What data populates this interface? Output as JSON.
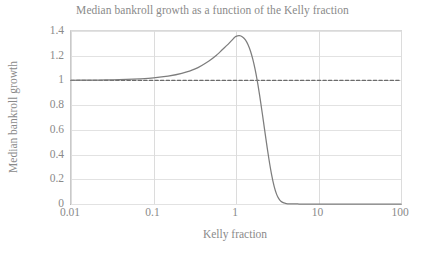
{
  "chart_data": {
    "type": "line",
    "title": "Median bankroll growth as a function of the Kelly fraction",
    "xlabel": "Kelly fraction",
    "ylabel": "Median bankroll growth",
    "xscale": "log",
    "yscale": "linear",
    "xlim": [
      0.01,
      100
    ],
    "ylim": [
      0,
      1.4
    ],
    "grid": true,
    "legend": "none",
    "xticks": [
      0.01,
      0.1,
      1,
      10,
      100
    ],
    "xtick_labels": [
      "0.01",
      "0.1",
      "1",
      "10",
      "100"
    ],
    "yticks": [
      0,
      0.2,
      0.4,
      0.6,
      0.8,
      1,
      1.2,
      1.4
    ],
    "ytick_labels": [
      "0",
      "0.2",
      "0.4",
      "0.6",
      "0.8",
      "1",
      "1.2",
      "1.4"
    ],
    "series": [
      {
        "name": "Median bankroll growth",
        "style": "solid",
        "color": "#7d7d7d",
        "x": [
          0.01,
          0.015,
          0.022,
          0.032,
          0.047,
          0.068,
          0.1,
          0.15,
          0.22,
          0.32,
          0.47,
          0.6,
          0.68,
          0.8,
          0.9,
          0.95,
          1.0,
          1.1,
          1.2,
          1.3,
          1.4,
          1.5,
          1.6,
          1.7,
          1.8,
          1.9,
          2.0,
          2.15,
          2.3,
          2.5,
          2.7,
          2.9,
          3.1,
          3.3,
          3.5,
          3.8,
          4.1,
          4.4,
          4.8,
          5.2,
          5.8,
          6.5,
          8.0,
          10.0,
          15.0,
          22.0,
          32.0,
          47.0,
          68.0,
          100.0
        ],
        "y": [
          1.001,
          1.002,
          1.003,
          1.005,
          1.008,
          1.013,
          1.021,
          1.035,
          1.057,
          1.093,
          1.158,
          1.213,
          1.248,
          1.292,
          1.328,
          1.345,
          1.357,
          1.362,
          1.352,
          1.328,
          1.289,
          1.236,
          1.17,
          1.093,
          1.006,
          0.912,
          0.815,
          0.669,
          0.531,
          0.368,
          0.238,
          0.143,
          0.08,
          0.043,
          0.022,
          0.0085,
          0.0032,
          0.0012,
          0.0004,
          0.0001,
          3e-05,
          0.0,
          0.0,
          0.0,
          0.0,
          0.0,
          0.0,
          0.0,
          0.0,
          0.0
        ]
      },
      {
        "name": "Break-even reference",
        "style": "dashed",
        "color": "#6b6b6b",
        "x": [
          0.01,
          100
        ],
        "y": [
          1.0,
          1.0
        ]
      }
    ],
    "annotations": [],
    "peak": {
      "x": 1.08,
      "y": 1.362
    },
    "colors": {
      "curve": "#7d7d7d",
      "reference_line": "#6b6b6b",
      "gridline": "#e2e2e2",
      "axis": "#a8a8a8",
      "text": "#8a8a8a",
      "background": "#ffffff"
    }
  }
}
